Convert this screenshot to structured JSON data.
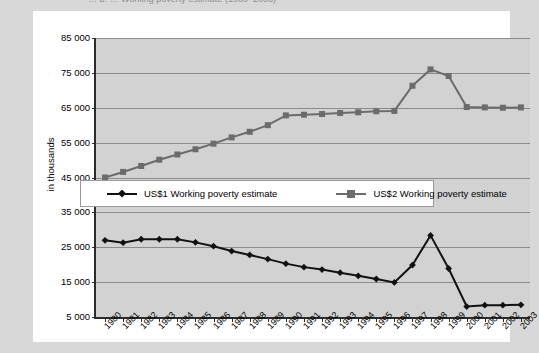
{
  "page": {
    "cropped_title": "…  b.  …  Working poverty estimate  (1980–2003)",
    "background_color": "#d8d8d8",
    "card_color": "#ffffff"
  },
  "chart_data": {
    "type": "line",
    "title": "",
    "xlabel": "",
    "ylabel": "in thousands",
    "ylim": [
      5000,
      85000
    ],
    "ytick_step": 10000,
    "grid": true,
    "legend_position": "inside-center-left",
    "plot_background": "#d2d2d2",
    "gridline_color": "#8b8b8b",
    "axis_color": "#2b2b2b",
    "yticks": [
      "85 000",
      "75 000",
      "65 000",
      "55 000",
      "45 000",
      "35 000",
      "25 000",
      "15 000",
      "5 000"
    ],
    "ytick_values": [
      85000,
      75000,
      65000,
      55000,
      45000,
      35000,
      25000,
      15000,
      5000
    ],
    "categories": [
      "1980",
      "1981",
      "1982",
      "1983",
      "1984",
      "1985",
      "1986",
      "1987",
      "1988",
      "1989",
      "1990",
      "1991",
      "1992",
      "1993",
      "1994",
      "1995",
      "1996",
      "1997",
      "1998",
      "1999",
      "2000",
      "2001",
      "2002",
      "2003"
    ],
    "series": [
      {
        "name": "US$1 Working poverty estimate",
        "color": "#111111",
        "marker": "diamond",
        "values": [
          27000,
          26300,
          27300,
          27300,
          27300,
          26400,
          25300,
          23900,
          22800,
          21600,
          20300,
          19300,
          18600,
          17700,
          16800,
          15900,
          14900,
          19900,
          28400,
          18900,
          8000,
          8400,
          8400,
          8500
        ]
      },
      {
        "name": "US$2 Working poverty estimate",
        "color": "#6b6b6b",
        "marker": "square",
        "values": [
          45000,
          46600,
          48300,
          50100,
          51600,
          53100,
          54700,
          56500,
          58100,
          60000,
          62800,
          63000,
          63200,
          63500,
          63700,
          64000,
          64100,
          71300,
          76000,
          74100,
          65200,
          65100,
          65000,
          65100
        ]
      }
    ]
  },
  "legend": {
    "items": [
      {
        "label": "US$1 Working poverty estimate",
        "color": "#111111",
        "marker": "diamond"
      },
      {
        "label": "US$2 Working poverty estimate",
        "color": "#6b6b6b",
        "marker": "square"
      }
    ]
  }
}
